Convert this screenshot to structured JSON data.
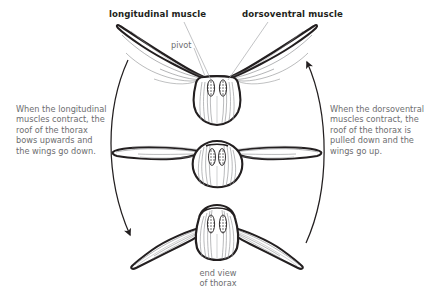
{
  "diagram": {
    "title_labels": {
      "longitudinal": "longitudinal muscle",
      "dorsoventral": "dorsoventral muscle",
      "pivot": "pivot"
    },
    "captions": {
      "left": "When the longitudinal\nmuscles contract, the\nroof of the thorax\nbows upwards and\nthe wings go down.",
      "right": "When the dorsoventral\nmuscles contract, the\nroof of the thorax is\npulled down and the\nwings go up."
    },
    "bottom_label": "end view\nof thorax",
    "figures": [
      {
        "name": "wings-up-thorax-pulled-down",
        "position": "top",
        "wing_state": "raised",
        "roof_state": "pulled down"
      },
      {
        "name": "wings-horizontal-neutral",
        "position": "middle",
        "wing_state": "horizontal",
        "roof_state": "neutral"
      },
      {
        "name": "wings-down-thorax-bowed-up",
        "position": "bottom",
        "wing_state": "lowered",
        "roof_state": "bowed upwards"
      }
    ],
    "arrows": [
      {
        "name": "left-cycle-arrow",
        "direction": "downward"
      },
      {
        "name": "right-cycle-arrow",
        "direction": "upward"
      }
    ],
    "colors": {
      "outline": "#231f20",
      "text_muted": "#6d6e70",
      "text_bold": "#231f20",
      "leader_line": "#a7a9ac",
      "wing_vein": "#808285",
      "background": "#ffffff"
    }
  }
}
